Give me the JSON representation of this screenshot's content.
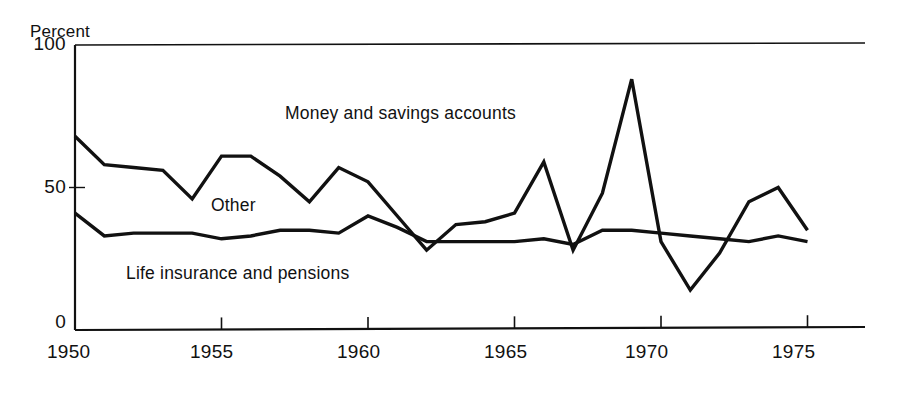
{
  "chart_data": {
    "type": "line",
    "title": "",
    "subtitle": "",
    "ylabel": "Percent",
    "xlabel": "",
    "ylim": [
      0,
      100
    ],
    "xlim": [
      1950,
      1975
    ],
    "grid": false,
    "legend_position": "inline-annotations",
    "y_ticks": [
      "0",
      "50",
      "100"
    ],
    "y_tick_values": [
      0,
      50,
      100
    ],
    "x_ticks": [
      "1950",
      "1955",
      "1960",
      "1965",
      "1970",
      "1975"
    ],
    "x_tick_values": [
      1950,
      1955,
      1960,
      1965,
      1970,
      1975
    ],
    "x": [
      1950,
      1951,
      1952,
      1953,
      1954,
      1955,
      1956,
      1957,
      1958,
      1959,
      1960,
      1961,
      1962,
      1963,
      1964,
      1965,
      1966,
      1967,
      1968,
      1969,
      1970,
      1971,
      1972,
      1973,
      1974,
      1975
    ],
    "series": [
      {
        "name": "Money and savings accounts",
        "color": "#111111",
        "values": [
          68,
          58,
          57,
          56,
          46,
          61,
          61,
          54,
          45,
          57,
          52,
          40,
          28,
          37,
          38,
          41,
          59,
          28,
          48,
          88,
          31,
          14,
          27,
          45,
          50,
          35
        ]
      },
      {
        "name": "Life insurance and pensions",
        "color": "#111111",
        "values": [
          41,
          33,
          34,
          34,
          34,
          32,
          33,
          35,
          35,
          34,
          40,
          36,
          31,
          31,
          31,
          31,
          32,
          30,
          35,
          35,
          34,
          33,
          32,
          31,
          33,
          31
        ]
      }
    ],
    "annotations": [
      {
        "text": "Money and savings accounts",
        "x": 285,
        "y": 103
      },
      {
        "text": "Other",
        "x": 211,
        "y": 195
      },
      {
        "text": "Life insurance and pensions",
        "x": 126,
        "y": 263
      }
    ],
    "axis_color": "#111111",
    "background_color": "#ffffff"
  },
  "geometry": {
    "plot_left": 75,
    "plot_right": 865,
    "plot_top": 45,
    "plot_bottom": 330,
    "y_zero_px": 330,
    "y_hundred_px": 45,
    "px_per_year": 29.3
  }
}
